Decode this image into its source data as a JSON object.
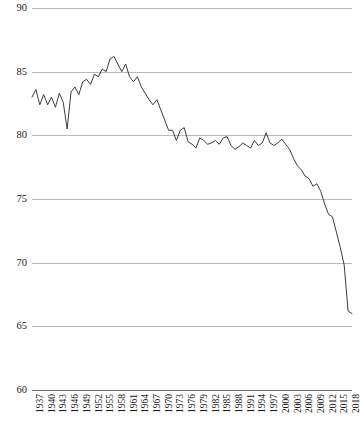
{
  "chart_data": {
    "type": "line",
    "title": "",
    "subtitle": "",
    "xlabel": "",
    "ylabel": "",
    "ylim": [
      60,
      90
    ],
    "y_ticks": [
      60,
      65,
      70,
      75,
      80,
      85,
      90
    ],
    "xlim": [
      1937,
      2019
    ],
    "x_tick_step": 3,
    "x_ticks": [
      1937,
      1940,
      1943,
      1946,
      1949,
      1952,
      1955,
      1958,
      1961,
      1964,
      1967,
      1970,
      1973,
      1976,
      1979,
      1982,
      1985,
      1988,
      1991,
      1994,
      1997,
      2000,
      2003,
      2006,
      2009,
      2012,
      2015,
      2018
    ],
    "grid": true,
    "grid_color": "#b9b9b9",
    "line_color": "#3b3b3b",
    "legend": null,
    "legend_position": "none",
    "series": [
      {
        "name": "series-1",
        "x": [
          1937,
          1938,
          1939,
          1940,
          1941,
          1942,
          1943,
          1944,
          1945,
          1946,
          1947,
          1948,
          1949,
          1950,
          1951,
          1952,
          1953,
          1954,
          1955,
          1956,
          1957,
          1958,
          1959,
          1960,
          1961,
          1962,
          1963,
          1964,
          1965,
          1966,
          1967,
          1968,
          1969,
          1970,
          1971,
          1972,
          1973,
          1974,
          1975,
          1976,
          1977,
          1978,
          1979,
          1980,
          1981,
          1982,
          1983,
          1984,
          1985,
          1986,
          1987,
          1988,
          1989,
          1990,
          1991,
          1992,
          1993,
          1994,
          1995,
          1996,
          1997,
          1998,
          1999,
          2000,
          2001,
          2002,
          2003,
          2004,
          2005,
          2006,
          2007,
          2008,
          2009,
          2010,
          2011,
          2012,
          2013,
          2014,
          2015,
          2016,
          2017,
          2018,
          2019
        ],
        "y": [
          83.0,
          83.6,
          82.4,
          83.2,
          82.4,
          83.0,
          82.2,
          83.3,
          82.6,
          80.5,
          83.4,
          83.8,
          83.2,
          84.2,
          84.4,
          84.0,
          84.8,
          84.6,
          85.2,
          85.0,
          86.0,
          86.2,
          85.6,
          85.0,
          85.6,
          84.6,
          84.2,
          84.6,
          83.8,
          83.3,
          82.8,
          82.4,
          82.8,
          82.0,
          81.2,
          80.4,
          80.4,
          79.6,
          80.4,
          80.6,
          79.5,
          79.3,
          79.0,
          79.8,
          79.6,
          79.3,
          79.4,
          79.6,
          79.3,
          79.8,
          79.9,
          79.2,
          78.9,
          79.1,
          79.4,
          79.2,
          79.0,
          79.6,
          79.2,
          79.4,
          80.2,
          79.4,
          79.2,
          79.4,
          79.7,
          79.3,
          78.9,
          78.2,
          77.6,
          77.3,
          76.8,
          76.6,
          76.0,
          76.2,
          75.6,
          74.6,
          73.8,
          73.6,
          72.4,
          71.2,
          69.8,
          66.2,
          66.0
        ]
      }
    ]
  }
}
